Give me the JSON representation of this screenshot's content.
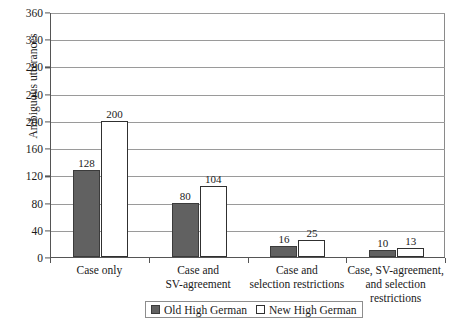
{
  "chart_data": {
    "type": "bar",
    "title": "",
    "xlabel": "",
    "ylabel": "Ambiguous utterances",
    "ylim": [
      0,
      360
    ],
    "ytick_step": 40,
    "yticks": [
      0,
      40,
      80,
      120,
      160,
      200,
      240,
      280,
      320,
      360
    ],
    "grid": true,
    "legend_position": "bottom-center",
    "categories": [
      "Case only",
      "Case and SV-agreement",
      "Case and selection restrictions",
      "Case, SV-agreement, and selection restrictions"
    ],
    "category_lines": [
      [
        "Case only"
      ],
      [
        "Case and",
        "SV-agreement"
      ],
      [
        "Case and",
        "selection restrictions"
      ],
      [
        "Case, SV-agreement,",
        "and selection",
        "restrictions"
      ]
    ],
    "series": [
      {
        "name": "Old High German",
        "color": "#616161",
        "values": [
          128,
          80,
          16,
          10
        ]
      },
      {
        "name": "New High German",
        "color": "#ffffff",
        "values": [
          200,
          104,
          25,
          13
        ]
      }
    ]
  },
  "legend": {
    "items": [
      {
        "label": "Old High German",
        "swatch": "filled-gray-square-icon"
      },
      {
        "label": "New High German",
        "swatch": "outlined-white-square-icon"
      }
    ]
  }
}
